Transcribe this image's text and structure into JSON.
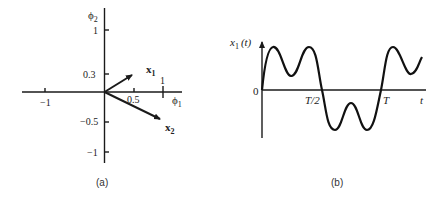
{
  "panel_a": {
    "caption": "(a)",
    "x_axis_label": "ϕ",
    "x_axis_sub": "1",
    "y_axis_label": "ϕ",
    "y_axis_sub": "2",
    "x_ticks": [
      {
        "label": "−1",
        "value": -1
      },
      {
        "label": "0.5",
        "value": 0.5
      },
      {
        "label": "1",
        "value": 1
      }
    ],
    "y_ticks": [
      {
        "label": "1",
        "value": 1
      },
      {
        "label": "0.3",
        "value": 0.3
      },
      {
        "label": "−0.5",
        "value": -0.5
      },
      {
        "label": "−1",
        "value": -1
      }
    ],
    "vectors": [
      {
        "name": "x",
        "sub": "1",
        "phi1": 0.5,
        "phi2": 0.3
      },
      {
        "name": "x",
        "sub": "2",
        "phi1": 1.0,
        "phi2": -0.5
      }
    ]
  },
  "panel_b": {
    "caption": "(b)",
    "y_axis_label": "x",
    "y_axis_sub": "1",
    "y_axis_arg": "(t)",
    "x_axis_label": "t",
    "origin_label": "0",
    "x_ticks": [
      {
        "label": "T/2"
      },
      {
        "label": "T"
      }
    ]
  }
}
